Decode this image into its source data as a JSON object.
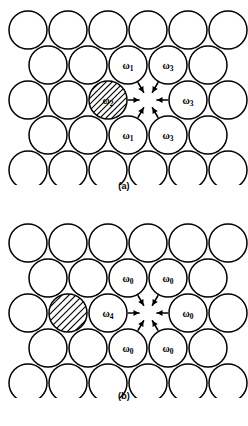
{
  "figure": {
    "stroke_color": "#000000",
    "fill_color": "#ffffff"
  },
  "panels": [
    {
      "id": "a",
      "caption": "(a)",
      "lattice": {
        "rows": [
          6,
          5,
          6,
          5,
          6
        ],
        "radius": 19,
        "x_spacing": 40,
        "y_spacing": 35,
        "row_offsets": [
          0,
          20,
          0,
          20,
          0
        ]
      },
      "vacancy": {
        "row": 2,
        "col": 3,
        "label": ""
      },
      "hatched_atom": {
        "row": 2,
        "col": 2,
        "label": "ω",
        "sub": "2",
        "hatch_spacing": 6
      },
      "labeled_atoms": [
        {
          "row": 1,
          "col": 2,
          "label": "ω",
          "sub": "1",
          "arrow": "down-right"
        },
        {
          "row": 1,
          "col": 3,
          "label": "ω",
          "sub": "3",
          "arrow": "down-left"
        },
        {
          "row": 2,
          "col": 2,
          "label": "ω",
          "sub": "2",
          "arrow": "right"
        },
        {
          "row": 2,
          "col": 4,
          "label": "ω",
          "sub": "3",
          "arrow": "left"
        },
        {
          "row": 3,
          "col": 2,
          "label": "ω",
          "sub": "1",
          "arrow": "up-right"
        },
        {
          "row": 3,
          "col": 3,
          "label": "ω",
          "sub": "3",
          "arrow": "up-left"
        }
      ]
    },
    {
      "id": "b",
      "caption": "(b)",
      "lattice": {
        "rows": [
          6,
          5,
          6,
          5,
          6
        ],
        "radius": 19,
        "x_spacing": 40,
        "y_spacing": 35,
        "row_offsets": [
          0,
          20,
          0,
          20,
          0
        ]
      },
      "vacancy": {
        "row": 2,
        "col": 3,
        "label": ""
      },
      "hatched_atom": {
        "row": 2,
        "col": 1,
        "label": "",
        "sub": "",
        "hatch_spacing": 7
      },
      "labeled_atoms": [
        {
          "row": 1,
          "col": 2,
          "label": "ω",
          "sub": "0",
          "arrow": "down-right"
        },
        {
          "row": 1,
          "col": 3,
          "label": "ω",
          "sub": "0",
          "arrow": "down-left"
        },
        {
          "row": 2,
          "col": 2,
          "label": "ω",
          "sub": "4",
          "arrow": "right"
        },
        {
          "row": 2,
          "col": 4,
          "label": "ω",
          "sub": "0",
          "arrow": "left"
        },
        {
          "row": 3,
          "col": 2,
          "label": "ω",
          "sub": "0",
          "arrow": "up-right"
        },
        {
          "row": 3,
          "col": 3,
          "label": "ω",
          "sub": "0",
          "arrow": "up-left"
        }
      ]
    }
  ]
}
